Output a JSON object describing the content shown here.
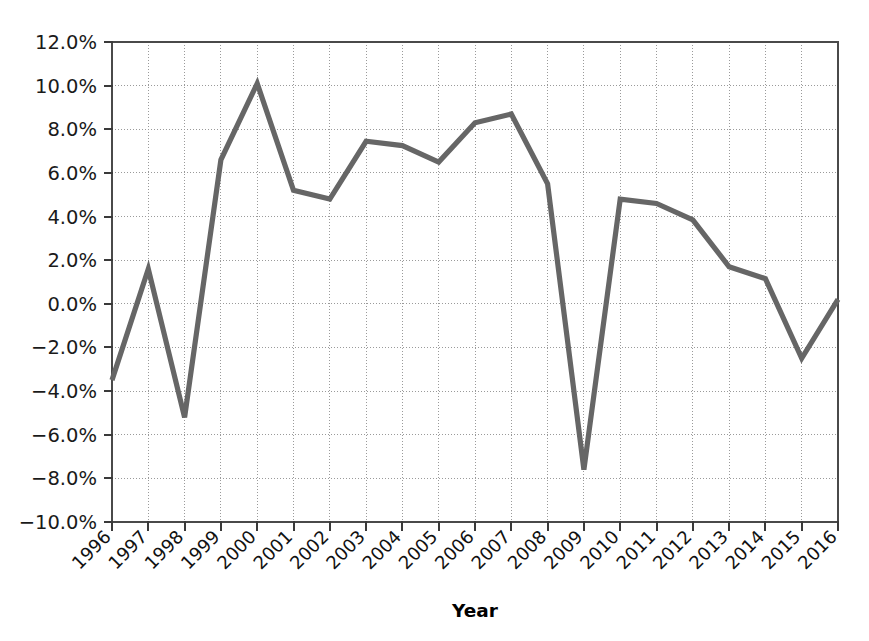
{
  "chart_data": {
    "type": "line",
    "title": "",
    "xlabel": "Year",
    "ylabel": "",
    "categories": [
      "1996",
      "1997",
      "1998",
      "1999",
      "2000",
      "2001",
      "2002",
      "2003",
      "2004",
      "2005",
      "2006",
      "2007",
      "2008",
      "2009",
      "2010",
      "2011",
      "2012",
      "2013",
      "2014",
      "2015",
      "2016"
    ],
    "values": [
      -3.5,
      1.6,
      -5.2,
      6.6,
      10.1,
      5.2,
      4.8,
      7.45,
      7.25,
      6.5,
      8.3,
      8.7,
      5.5,
      -7.6,
      4.8,
      4.6,
      3.85,
      1.7,
      1.15,
      -2.5,
      0.2
    ],
    "series": [
      {
        "name": "series-1",
        "values": [
          -3.5,
          1.6,
          -5.2,
          6.6,
          10.1,
          5.2,
          4.8,
          7.45,
          7.25,
          6.5,
          8.3,
          8.7,
          5.5,
          -7.6,
          4.8,
          4.6,
          3.85,
          1.7,
          1.15,
          -2.5,
          0.2
        ],
        "color": "#666666"
      }
    ],
    "ylim": [
      -10.0,
      12.0
    ],
    "ytick_values": [
      12.0,
      10.0,
      8.0,
      6.0,
      4.0,
      2.0,
      0.0,
      -2.0,
      -4.0,
      -6.0,
      -8.0,
      -10.0
    ],
    "ytick_labels": [
      "12.0%",
      "10.0%",
      "8.0%",
      "6.0%",
      "4.0%",
      "2.0%",
      "0.0%",
      "−2.0%",
      "−4.0%",
      "−6.0%",
      "−8.0%",
      "−10.0%"
    ],
    "grid": true,
    "grid_axes": "both",
    "legend": false,
    "legend_position": "none",
    "x_tick_rotation": 45
  },
  "colors": {
    "line": "#666666",
    "grid": "#9a9a9a",
    "frame": "#4a4a4a",
    "text": "#1a1a1a",
    "background": "#ffffff"
  }
}
